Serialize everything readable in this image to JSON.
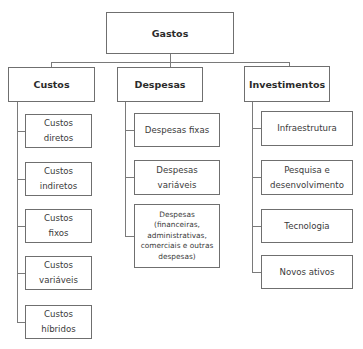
{
  "diagram": {
    "type": "hierarchy",
    "root": {
      "label": "Gastos"
    },
    "branches": [
      {
        "label": "Custos",
        "children": [
          "Custos\ndiretos",
          "Custos\nindiretos",
          "Custos\nfixos",
          "Custos\nvariáveis",
          "Custos\nhíbridos"
        ]
      },
      {
        "label": "Despesas",
        "children": [
          "Despesas fixas",
          "Despesas variáveis",
          "Despesas\n(financeiras,\nadministrativas,\ncomerciais e outras\ndespesas)"
        ]
      },
      {
        "label": "Investimentos",
        "children": [
          "Infraestrutura",
          "Pesquisa e\ndesenvolvimento",
          "Tecnologia",
          "Novos ativos"
        ]
      }
    ],
    "colors": {
      "border": "#6f6f6f",
      "connector": "#7a7a7a",
      "text": "#2b2b2b",
      "background": "#ffffff"
    }
  }
}
